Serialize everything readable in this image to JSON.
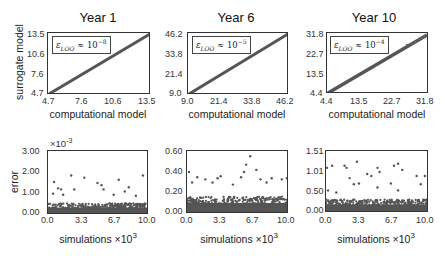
{
  "figure": {
    "row1_ylabel": "surrogate model",
    "row2_ylabel": "error",
    "top_xlabel": "computational model",
    "bottom_xlabel": "simulations",
    "bottom_xlabel_exp": "×10",
    "bottom_xlabel_exp_power": "3",
    "marker_color": "#555555"
  },
  "chart_data": [
    {
      "type": "scatter",
      "title": "Year 1",
      "xlabel": "computational model",
      "ylabel": "surrogate model",
      "xlim": [
        4.7,
        13.5
      ],
      "ylim": [
        4.7,
        13.5
      ],
      "xticks": [
        "4.7",
        "7.6",
        "10.6",
        "13.5"
      ],
      "yticks": [
        "4.7",
        "7.6",
        "10.6",
        "13.5"
      ],
      "legend": {
        "symbol": "ε",
        "sub": "LOO",
        "approx": "≈ 10",
        "power": "−8"
      },
      "description": "points along y = x diagonal"
    },
    {
      "type": "scatter",
      "title": "Year 6",
      "xlabel": "computational model",
      "ylabel": "",
      "xlim": [
        9.0,
        46.2
      ],
      "ylim": [
        9.0,
        46.2
      ],
      "xticks": [
        "9.0",
        "21.4",
        "33.8",
        "46.2"
      ],
      "yticks": [
        "9.0",
        "21.4",
        "33.8",
        "46.2"
      ],
      "legend": {
        "symbol": "ε",
        "sub": "LOO",
        "approx": "≈ 10",
        "power": "−5"
      },
      "description": "points along y = x diagonal"
    },
    {
      "type": "scatter",
      "title": "Year 10",
      "xlabel": "computational model",
      "ylabel": "",
      "xlim": [
        4.4,
        31.8
      ],
      "ylim": [
        4.4,
        31.8
      ],
      "xticks": [
        "4.4",
        "13.5",
        "22.7",
        "31.8"
      ],
      "yticks": [
        "4.4",
        "13.5",
        "22.7",
        "31.8"
      ],
      "legend": {
        "symbol": "ε",
        "sub": "LOO",
        "approx": "≈ 10",
        "power": "−4"
      },
      "description": "points along y = x diagonal, slight spread at high values"
    },
    {
      "type": "scatter",
      "title": "",
      "xlabel": "simulations ×10^3",
      "ylabel": "error",
      "xlim": [
        0.0,
        10.0
      ],
      "ylim": [
        0.0,
        3.0
      ],
      "y_multiplier": "×10^-3",
      "xticks": [
        "0.0",
        "3.3",
        "6.7",
        "10.0"
      ],
      "yticks": [
        "0.00",
        "1.00",
        "2.00",
        "3.00"
      ],
      "bulk_max": 0.5,
      "outliers": [
        [
          0.6,
          1.55
        ],
        [
          1.0,
          1.25
        ],
        [
          1.3,
          1.2
        ],
        [
          2.3,
          1.85
        ],
        [
          2.6,
          1.2
        ],
        [
          3.6,
          1.75
        ],
        [
          4.9,
          1.5
        ],
        [
          5.3,
          1.4
        ],
        [
          5.5,
          1.2
        ],
        [
          7.0,
          1.65
        ],
        [
          7.6,
          1.1
        ],
        [
          8.0,
          1.3
        ],
        [
          9.4,
          1.85
        ],
        [
          0.5,
          1.0
        ],
        [
          1.5,
          0.95
        ],
        [
          6.5,
          0.95
        ],
        [
          8.7,
          0.9
        ]
      ]
    },
    {
      "type": "scatter",
      "title": "",
      "xlabel": "simulations ×10^3",
      "ylabel": "",
      "xlim": [
        0.0,
        10.0
      ],
      "ylim": [
        0.0,
        0.6
      ],
      "xticks": [
        "0.0",
        "3.3",
        "6.7",
        "10.0"
      ],
      "yticks": [
        "0.00",
        "0.20",
        "0.40",
        "0.60"
      ],
      "bulk_max": 0.15,
      "outliers": [
        [
          0.2,
          0.4
        ],
        [
          1.0,
          0.35
        ],
        [
          1.8,
          0.33
        ],
        [
          3.0,
          0.34
        ],
        [
          3.3,
          0.36
        ],
        [
          5.3,
          0.35
        ],
        [
          5.6,
          0.4
        ],
        [
          5.8,
          0.47
        ],
        [
          6.2,
          0.55
        ],
        [
          6.8,
          0.42
        ],
        [
          7.2,
          0.33
        ],
        [
          8.3,
          0.34
        ],
        [
          9.3,
          0.33
        ],
        [
          9.8,
          0.34
        ],
        [
          0.5,
          0.3
        ],
        [
          2.5,
          0.3
        ],
        [
          4.5,
          0.28
        ],
        [
          7.8,
          0.3
        ]
      ]
    },
    {
      "type": "scatter",
      "title": "",
      "xlabel": "simulations ×10^3",
      "ylabel": "",
      "xlim": [
        0.0,
        10.0
      ],
      "ylim": [
        0.0,
        1.51
      ],
      "xticks": [
        "0.0",
        "3.3",
        "6.7",
        "10.0"
      ],
      "yticks": [
        "0.00",
        "0.50",
        "1.01",
        "1.51"
      ],
      "bulk_max": 0.3,
      "outliers": [
        [
          0.1,
          1.1
        ],
        [
          0.6,
          1.15
        ],
        [
          1.8,
          1.15
        ],
        [
          2.0,
          1.1
        ],
        [
          2.3,
          0.85
        ],
        [
          3.0,
          1.25
        ],
        [
          4.0,
          0.95
        ],
        [
          4.4,
          0.9
        ],
        [
          5.0,
          1.1
        ],
        [
          5.2,
          1.0
        ],
        [
          6.6,
          1.15
        ],
        [
          7.0,
          1.2
        ],
        [
          7.4,
          1.05
        ],
        [
          8.8,
          0.9
        ],
        [
          9.6,
          0.9
        ],
        [
          2.7,
          0.7
        ],
        [
          3.2,
          0.72
        ],
        [
          6.3,
          0.72
        ],
        [
          9.2,
          0.7
        ],
        [
          0.2,
          0.55
        ],
        [
          1.0,
          0.5
        ],
        [
          5.0,
          0.62
        ],
        [
          7.0,
          0.55
        ]
      ]
    }
  ]
}
